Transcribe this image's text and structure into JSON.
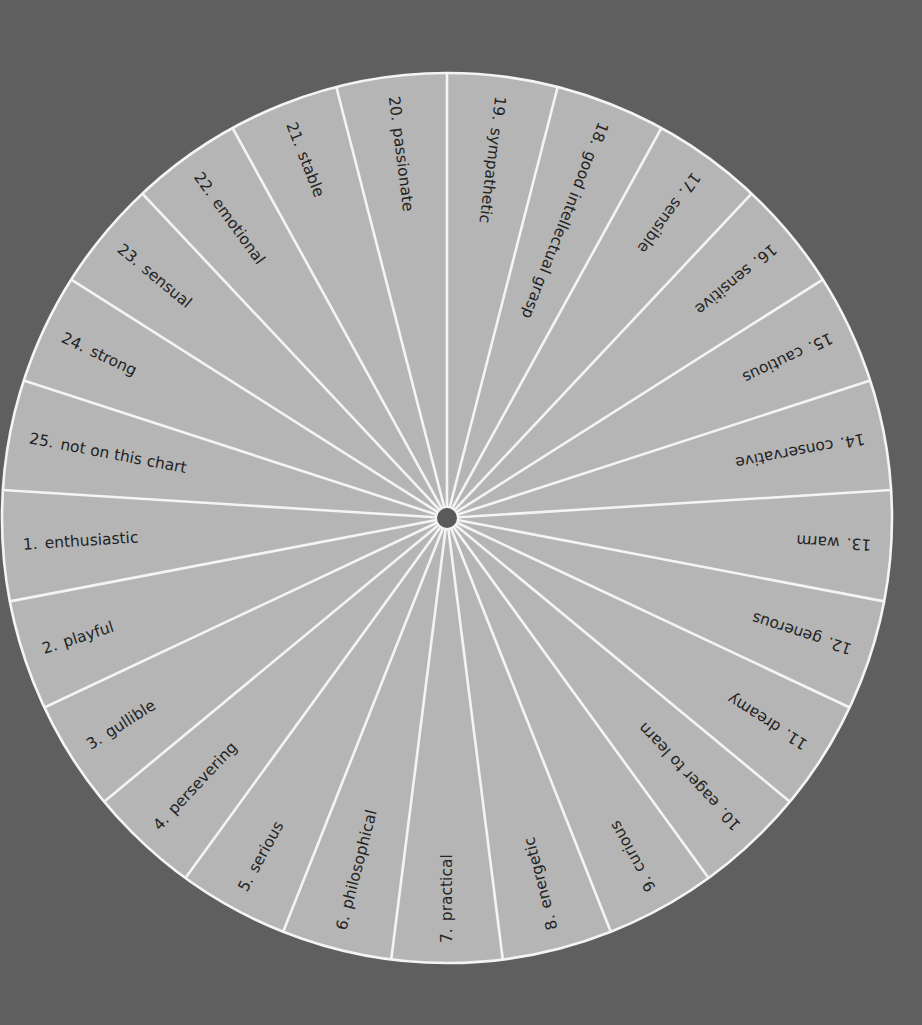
{
  "diagram": {
    "type": "radial-wheel",
    "center": [
      447,
      518
    ],
    "radius": 445,
    "hub_radius": 11,
    "segment_count": 25,
    "first_divider_angle_deg": -90,
    "direction": "counter-clockwise from top (20 is left of top divider, 19 right of it)",
    "colors": {
      "background": "#5f5f5f",
      "segment_fill": "#b5b5b5",
      "divider": "#f4f4f4",
      "hub": "#5a5a5a",
      "text": "#232323"
    },
    "segments": [
      {
        "number": "1.",
        "label": "enthusiastic"
      },
      {
        "number": "2.",
        "label": "playful"
      },
      {
        "number": "3.",
        "label": "gullible"
      },
      {
        "number": "4.",
        "label": "persevering"
      },
      {
        "number": "5.",
        "label": "serious"
      },
      {
        "number": "6.",
        "label": "philosophical"
      },
      {
        "number": "7.",
        "label": "practical"
      },
      {
        "number": "8.",
        "label": "energetic"
      },
      {
        "number": "9.",
        "label": "curious"
      },
      {
        "number": "10.",
        "label": "eager to learn"
      },
      {
        "number": "11.",
        "label": "dreamy"
      },
      {
        "number": "12.",
        "label": "generous"
      },
      {
        "number": "13.",
        "label": "warm"
      },
      {
        "number": "14.",
        "label": "conservative"
      },
      {
        "number": "15.",
        "label": "cautious"
      },
      {
        "number": "16.",
        "label": "sensitive"
      },
      {
        "number": "17.",
        "label": "sensible"
      },
      {
        "number": "18.",
        "label": "good intellectual grasp"
      },
      {
        "number": "19.",
        "label": "sympathetic"
      },
      {
        "number": "20.",
        "label": "passionate"
      },
      {
        "number": "21.",
        "label": "stable"
      },
      {
        "number": "22.",
        "label": "emotional"
      },
      {
        "number": "23.",
        "label": "sensual"
      },
      {
        "number": "24.",
        "label": "strong"
      },
      {
        "number": "25.",
        "label": "not on this chart"
      }
    ]
  }
}
